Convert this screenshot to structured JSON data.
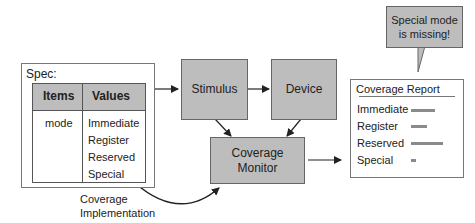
{
  "spec": {
    "title": "Spec:",
    "table": {
      "headers": [
        "Items",
        "Values"
      ],
      "rows": [
        {
          "item": "mode",
          "values": [
            "Immediate",
            "Register",
            "Reserved",
            "Special"
          ]
        }
      ]
    }
  },
  "blocks": {
    "stimulus": "Stimulus",
    "device": "Device",
    "coverage_monitor_line1": "Coverage",
    "coverage_monitor_line2": "Monitor"
  },
  "report": {
    "title": "Coverage Report",
    "items": [
      {
        "label": "Immediate",
        "bar_width": 24
      },
      {
        "label": "Register",
        "bar_width": 16
      },
      {
        "label": "Reserved",
        "bar_width": 32
      },
      {
        "label": "Special",
        "bar_width": 5
      }
    ]
  },
  "callout": {
    "line1": "Special mode",
    "line2": "is missing!"
  },
  "implementation_label": {
    "line1": "Coverage",
    "line2": "Implementation"
  },
  "colors": {
    "block_fill": "#bdbdbd",
    "border": "#666666",
    "bar": "#8a8a8a"
  }
}
